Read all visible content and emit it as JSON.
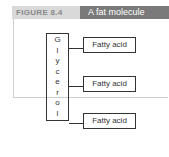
{
  "figure": {
    "label": "FIGURE 8.4",
    "title": "A fat molecule"
  },
  "diagram": {
    "backbone": {
      "name": "Glycerol",
      "letters": [
        "G",
        "l",
        "y",
        "c",
        "e",
        "r",
        "o",
        "l"
      ]
    },
    "chains": [
      {
        "label": "Fatty acid"
      },
      {
        "label": "Fatty acid"
      },
      {
        "label": "Fatty acid"
      }
    ]
  },
  "colors": {
    "label_bg": "#d9d9d9",
    "title_bg": "#7a7a7a",
    "stroke": "#333333"
  }
}
